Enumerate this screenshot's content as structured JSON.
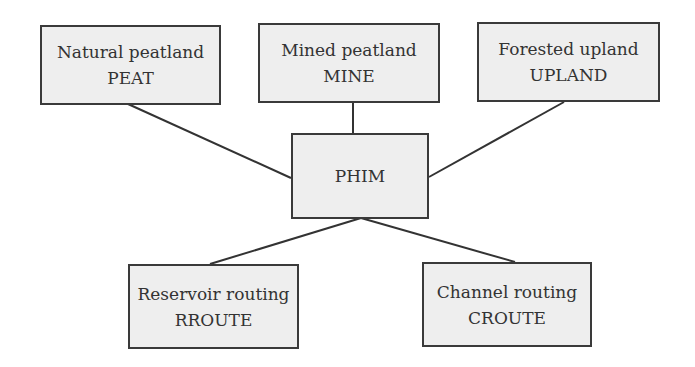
{
  "diagram": {
    "colors": {
      "box_fill": "#eeeeee",
      "box_border": "#3a3a3a",
      "line": "#333333",
      "text": "#333333"
    },
    "nodes": {
      "peat": {
        "label": "Natural peatland",
        "code": "PEAT"
      },
      "mine": {
        "label": "Mined peatland",
        "code": "MINE"
      },
      "upland": {
        "label": "Forested upland",
        "code": "UPLAND"
      },
      "phim": {
        "label": "PHIM"
      },
      "rroute": {
        "label": "Reservoir routing",
        "code": "RROUTE"
      },
      "croute": {
        "label": "Channel routing",
        "code": "CROUTE"
      }
    },
    "edges": [
      {
        "from": "PEAT",
        "to": "PHIM"
      },
      {
        "from": "MINE",
        "to": "PHIM"
      },
      {
        "from": "UPLAND",
        "to": "PHIM"
      },
      {
        "from": "PHIM",
        "to": "RROUTE"
      },
      {
        "from": "PHIM",
        "to": "CROUTE"
      }
    ]
  }
}
